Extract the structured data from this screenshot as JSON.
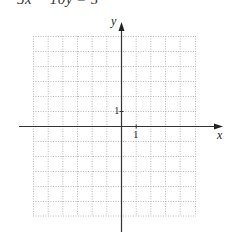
{
  "equation": {
    "lhs_a": "5x",
    "op1": "−",
    "lhs_b": "10y",
    "eq": "=",
    "rhs": "5",
    "full": "5x − 10y = 5"
  },
  "axes": {
    "x_label": "x",
    "y_label": "y",
    "x_tick_label": "1",
    "y_tick_label": "1"
  },
  "grid": {
    "x_min": -6,
    "x_max": 5,
    "y_min": -6,
    "y_max": 6,
    "step": 1,
    "style": "dotted",
    "line_color": "#b8b8b8",
    "axis_color": "#333333"
  }
}
